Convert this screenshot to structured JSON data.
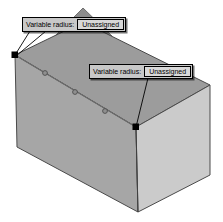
{
  "app": {
    "title": "Variable radius fillet preview",
    "background_color": "#ffffff"
  },
  "model": {
    "name": "rectangular-box",
    "faces": [
      {
        "name": "top-face",
        "fill": "#9e9e9e"
      },
      {
        "name": "front-left-face",
        "fill": "#a8a8a8"
      },
      {
        "name": "front-right-face",
        "fill": "#cccccc"
      },
      {
        "name": "back-peak-face",
        "fill": "#8a8a8a"
      }
    ],
    "outline_color": "#3c3c3c",
    "edge_color": "#555555"
  },
  "callouts": [
    {
      "id": "callout-1",
      "caption": "Variable radius:",
      "value": "Unassigned",
      "leader_target": "vertex-left",
      "box_fill": "#c8c8c8",
      "value_fill": "#d8d8d8",
      "border_color": "#000000"
    },
    {
      "id": "callout-2",
      "caption": "Variable radius:",
      "value": "Unassigned",
      "leader_target": "vertex-right",
      "box_fill": "#c8c8c8",
      "value_fill": "#d8d8d8",
      "border_color": "#000000"
    }
  ],
  "vertices": [
    {
      "name": "vertex-left",
      "x": 15,
      "y": 55,
      "color": "#000000",
      "size": 6
    },
    {
      "name": "vertex-right",
      "x": 136,
      "y": 127,
      "color": "#000000",
      "size": 6
    }
  ],
  "control_points": [
    {
      "name": "control-point-1",
      "x": 45,
      "y": 73,
      "color": "#707070"
    },
    {
      "name": "control-point-2",
      "x": 75,
      "y": 92,
      "color": "#707070"
    },
    {
      "name": "control-point-3",
      "x": 105,
      "y": 111,
      "color": "#707070"
    }
  ],
  "leader_lines": [
    {
      "name": "leader-line-left",
      "from_x": 30,
      "from_y": 31,
      "to_x": 15,
      "to_y": 55
    },
    {
      "name": "leader-line-right",
      "from_x": 148,
      "from_y": 78,
      "to_x": 136,
      "to_y": 127
    }
  ]
}
